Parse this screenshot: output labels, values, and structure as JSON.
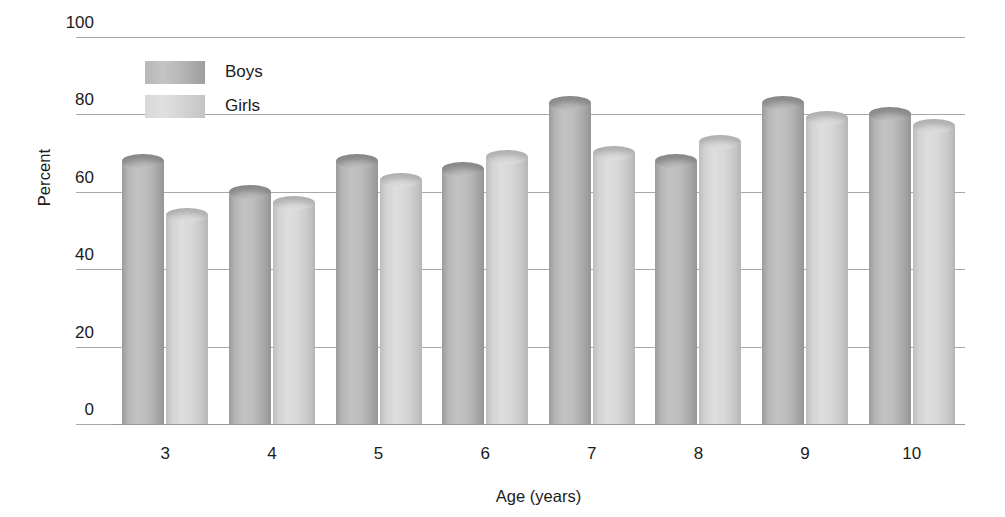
{
  "chart_data": {
    "type": "bar",
    "title": "",
    "subtitle": "",
    "xlabel": "Age (years)",
    "ylabel": "Percent",
    "categories": [
      "3",
      "4",
      "5",
      "6",
      "7",
      "8",
      "9",
      "10"
    ],
    "series": [
      {
        "name": "Boys",
        "values": [
          68,
          60,
          68,
          66,
          83,
          68,
          83,
          80
        ]
      },
      {
        "name": "Girls",
        "values": [
          54,
          57,
          63,
          69,
          70,
          73,
          79,
          77
        ]
      }
    ],
    "ylim": [
      0,
      100
    ],
    "yticks": [
      0,
      20,
      40,
      60,
      80,
      100
    ],
    "ytick_labels": [
      "0",
      "20",
      "40",
      "60",
      "80",
      "100"
    ],
    "grid": true,
    "grid_axis": "y",
    "legend_position": "upper left inside plot",
    "bar_style": "3d-cylinder",
    "colors": {
      "boys": "#b4b4b4",
      "girls": "#d6d6d6",
      "gridline": "#a8a8a8",
      "text": "#1b1b1b",
      "background": "#ffffff"
    }
  },
  "legend": {
    "entries": [
      {
        "label": "Boys",
        "series": "boys"
      },
      {
        "label": "Girls",
        "series": "girls"
      }
    ]
  }
}
